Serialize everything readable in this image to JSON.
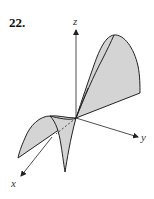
{
  "problem": {
    "number": "22."
  },
  "figure": {
    "type": "3d-surface-sketch",
    "axes": {
      "x_label": "x",
      "y_label": "y",
      "z_label": "z"
    },
    "colors": {
      "surface_fill": "#d4d4d4",
      "outline": "#222222",
      "axis": "#222222",
      "background": "#ffffff"
    }
  }
}
